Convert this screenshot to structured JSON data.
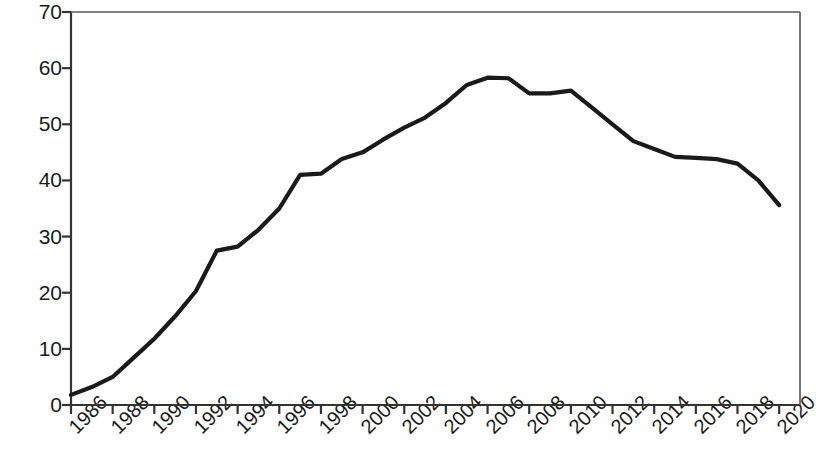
{
  "chart_data": {
    "type": "line",
    "title": "",
    "subtitle": "",
    "xlabel": "",
    "ylabel": "Percent",
    "xlim": [
      1986,
      2021
    ],
    "ylim": [
      0,
      70
    ],
    "grid": false,
    "legend": "none",
    "line_color": "#1a1a1a",
    "x_tick_labels": [
      "1986",
      "1988",
      "1990",
      "1992",
      "1994",
      "1996",
      "1998",
      "2000",
      "2002",
      "2004",
      "2006",
      "2008",
      "2010",
      "2012",
      "2014",
      "2016",
      "2018",
      "2020"
    ],
    "y_tick_labels": [
      "0",
      "10",
      "20",
      "30",
      "40",
      "50",
      "60",
      "70"
    ],
    "y_ticks": [
      0,
      10,
      20,
      30,
      40,
      50,
      60,
      70
    ],
    "x_ticks": [
      1986,
      1988,
      1990,
      1992,
      1994,
      1996,
      1998,
      2000,
      2002,
      2004,
      2006,
      2008,
      2010,
      2012,
      2014,
      2016,
      2018,
      2020
    ],
    "x": [
      1986,
      1987,
      1988,
      1989,
      1990,
      1991,
      1992,
      1993,
      1994,
      1995,
      1996,
      1997,
      1998,
      1999,
      2000,
      2001,
      2002,
      2003,
      2004,
      2005,
      2006,
      2007,
      2008,
      2009,
      2010,
      2011,
      2012,
      2013,
      2014,
      2015,
      2016,
      2017,
      2018,
      2019,
      2020
    ],
    "values": [
      1.8,
      3.2,
      5.0,
      8.4,
      11.8,
      15.8,
      20.3,
      27.5,
      28.2,
      31.2,
      35.0,
      41.0,
      41.2,
      43.8,
      45.0,
      47.3,
      49.4,
      51.2,
      53.8,
      57.0,
      58.3,
      58.2,
      55.5,
      55.5,
      56.0,
      53.0,
      50.0,
      47.0,
      45.6,
      44.2,
      44.0,
      43.8,
      43.0,
      40.0,
      35.6
    ]
  },
  "layout": {
    "plot_left": 71,
    "plot_right": 800,
    "plot_top": 12,
    "plot_bottom": 405
  }
}
